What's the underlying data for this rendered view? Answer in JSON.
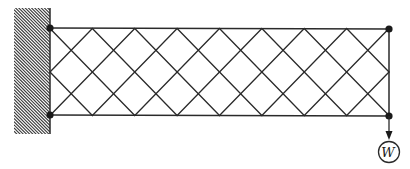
{
  "diagram": {
    "type": "lattice cantilever truss",
    "support": {
      "kind": "fixed wall",
      "hatched": true
    },
    "panels": 8,
    "nodes": [
      {
        "id": "top-left",
        "x": 50,
        "y": 28
      },
      {
        "id": "bottom-left",
        "x": 50,
        "y": 115
      },
      {
        "id": "top-right",
        "x": 389,
        "y": 29
      },
      {
        "id": "bottom-right",
        "x": 389,
        "y": 116
      }
    ],
    "load": {
      "label": "W",
      "direction": "down",
      "applied_at": "bottom-right"
    },
    "colors": {
      "line": "#2a2a2a",
      "node": "#1a1a1a",
      "background": "#ffffff"
    }
  }
}
